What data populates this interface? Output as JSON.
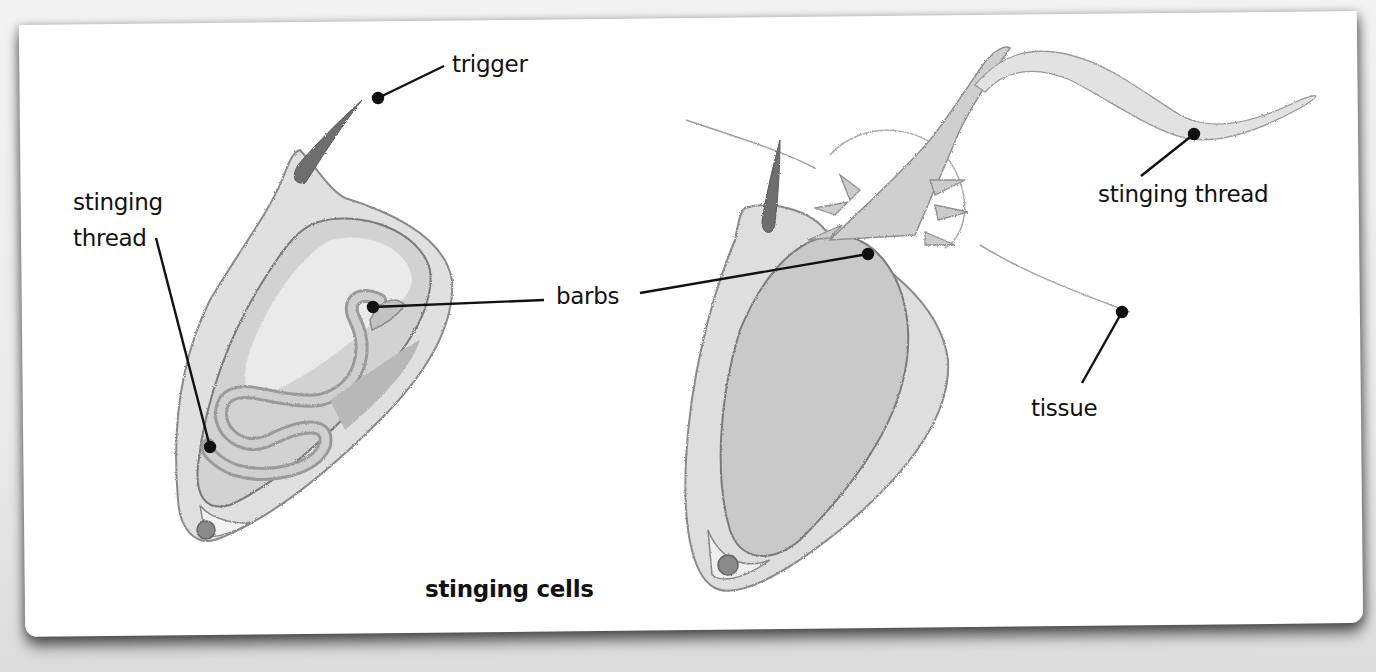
{
  "diagram": {
    "title": "stinging cells",
    "labels": {
      "trigger": "trigger",
      "stinging_thread_left_line1": "stinging",
      "stinging_thread_left_line2": "thread",
      "barbs": "barbs",
      "stinging_thread_right": "stinging thread",
      "tissue": "tissue"
    },
    "colors": {
      "card_background": "#ffffff",
      "page_background": "#eeeeee",
      "cell_fill": "#d6d6d6",
      "cell_dark": "#b5b5b5",
      "trigger_fill": "#6e6e6e",
      "leader_line": "#111111"
    }
  }
}
